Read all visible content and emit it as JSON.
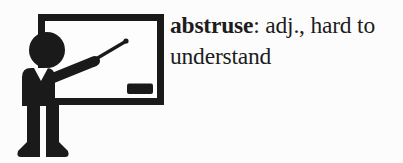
{
  "flashcard": {
    "term": "abstruse",
    "line1_rest": ": adj., hard to",
    "line2": "understand",
    "full_text": "abstruse: adj., hard to understand"
  },
  "illustration": {
    "icon_name": "teacher-pointing-at-whiteboard-icon",
    "elements": [
      "teacher-silhouette",
      "whiteboard",
      "pointer-stick",
      "board-eraser"
    ],
    "ink_color": "#1a1a1a",
    "board_fill": "#fdfdfd"
  },
  "colors": {
    "background": "#fcfcfc",
    "text": "#1d1d1d"
  }
}
